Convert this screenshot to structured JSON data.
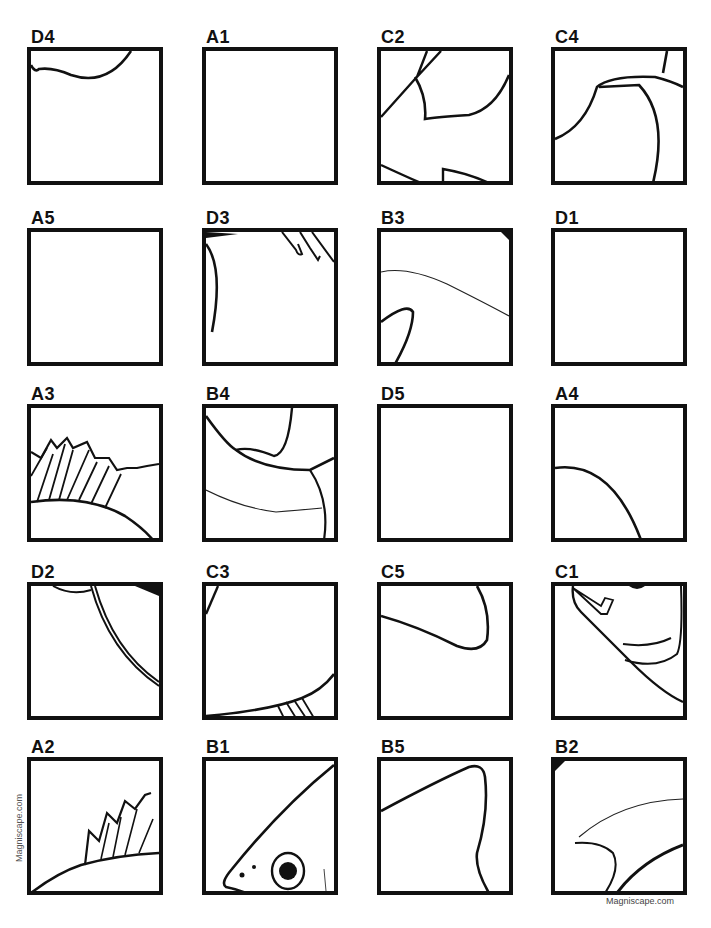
{
  "page": {
    "watermark_vertical": "Magniscape.com",
    "footer_credit": "Magniscape.com"
  },
  "grid": {
    "rows": [
      [
        {
          "label": "D4",
          "content": "curve-top"
        },
        {
          "label": "A1",
          "content": "blank"
        },
        {
          "label": "C2",
          "content": "fin-edges"
        },
        {
          "label": "C4",
          "content": "arc-body"
        }
      ],
      [
        {
          "label": "A5",
          "content": "blank"
        },
        {
          "label": "D3",
          "content": "fin-tips-corner"
        },
        {
          "label": "B3",
          "content": "thin-line-loop"
        },
        {
          "label": "D1",
          "content": "blank"
        }
      ],
      [
        {
          "label": "A3",
          "content": "dorsal-spines"
        },
        {
          "label": "B4",
          "content": "gill-curves"
        },
        {
          "label": "D5",
          "content": "blank"
        },
        {
          "label": "A4",
          "content": "quarter-arc"
        }
      ],
      [
        {
          "label": "D2",
          "content": "diagonal-arc"
        },
        {
          "label": "C3",
          "content": "bottom-fin"
        },
        {
          "label": "C5",
          "content": "fin-hook"
        },
        {
          "label": "C1",
          "content": "mouth-curves"
        }
      ],
      [
        {
          "label": "A2",
          "content": "spines-small"
        },
        {
          "label": "B1",
          "content": "fish-eye"
        },
        {
          "label": "B5",
          "content": "tail-lobe"
        },
        {
          "label": "B2",
          "content": "fin-swoosh"
        }
      ]
    ]
  }
}
